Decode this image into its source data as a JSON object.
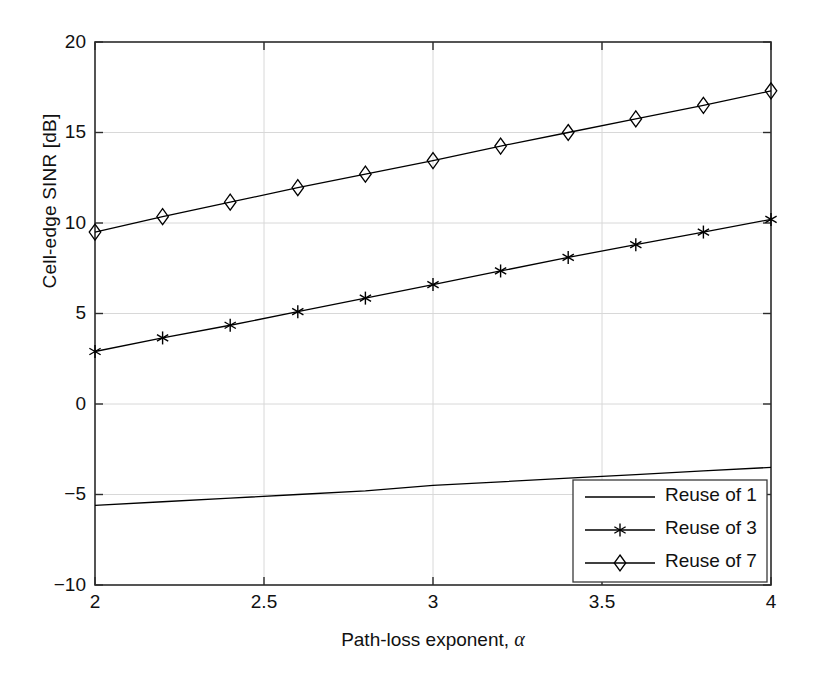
{
  "chart_data": {
    "type": "line",
    "title": "",
    "xlabel": "Path-loss exponent, α",
    "ylabel": "Cell-edge SINR [dB]",
    "xlim": [
      2,
      4
    ],
    "ylim": [
      -10,
      20
    ],
    "xticks": [
      "2",
      "2.5",
      "3",
      "3.5",
      "4"
    ],
    "xtick_values": [
      2,
      2.5,
      3,
      3.5,
      4
    ],
    "yticks": [
      "20",
      "15",
      "10",
      "5",
      "0",
      "−5",
      "−10"
    ],
    "ytick_values": [
      20,
      15,
      10,
      5,
      0,
      -5,
      -10
    ],
    "grid": true,
    "legend_position": "lower right",
    "x": [
      2,
      2.2,
      2.4,
      2.6,
      2.8,
      3.0,
      3.2,
      3.4,
      3.6,
      3.8,
      4.0
    ],
    "series": [
      {
        "name": "Reuse of 1",
        "marker": "none",
        "color": "#000000",
        "values": [
          -5.6,
          -5.4,
          -5.2,
          -5.0,
          -4.8,
          -4.5,
          -4.3,
          -4.1,
          -3.9,
          -3.7,
          -3.5
        ]
      },
      {
        "name": "Reuse of 3",
        "marker": "asterisk",
        "color": "#000000",
        "values": [
          2.9,
          3.65,
          4.35,
          5.1,
          5.85,
          6.6,
          7.35,
          8.1,
          8.8,
          9.5,
          10.2
        ]
      },
      {
        "name": "Reuse of 7",
        "marker": "diamond",
        "color": "#000000",
        "values": [
          9.5,
          10.35,
          11.15,
          11.95,
          12.7,
          13.45,
          14.25,
          15.0,
          15.75,
          16.5,
          17.3
        ]
      }
    ]
  },
  "legend": {
    "entries": [
      {
        "label": "Reuse of 1",
        "marker": "none"
      },
      {
        "label": "Reuse of 3",
        "marker": "asterisk"
      },
      {
        "label": "Reuse of 7",
        "marker": "diamond"
      }
    ]
  },
  "colors": {
    "axis": "#2b2b2b",
    "grid": "#d8d8d8",
    "line": "#000000",
    "background": "#ffffff"
  }
}
